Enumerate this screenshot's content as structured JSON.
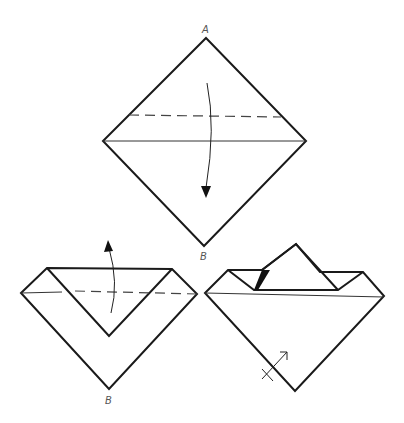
{
  "diagram": {
    "colors": {
      "line": "#1a1a1a",
      "label": "#555555",
      "background": "#ffffff"
    },
    "steps": [
      {
        "name": "step-1-square-diamond",
        "labels": {
          "top": "A",
          "bottom": "B"
        },
        "instruction": "valley fold top corner A down along dashed line"
      },
      {
        "name": "step-2-folded-down",
        "labels": {
          "bottom": "B"
        },
        "instruction": "fold the flap back up along dashed line"
      },
      {
        "name": "step-3-result",
        "labels": {},
        "instruction": "turn over (arrow with cross)"
      }
    ]
  }
}
